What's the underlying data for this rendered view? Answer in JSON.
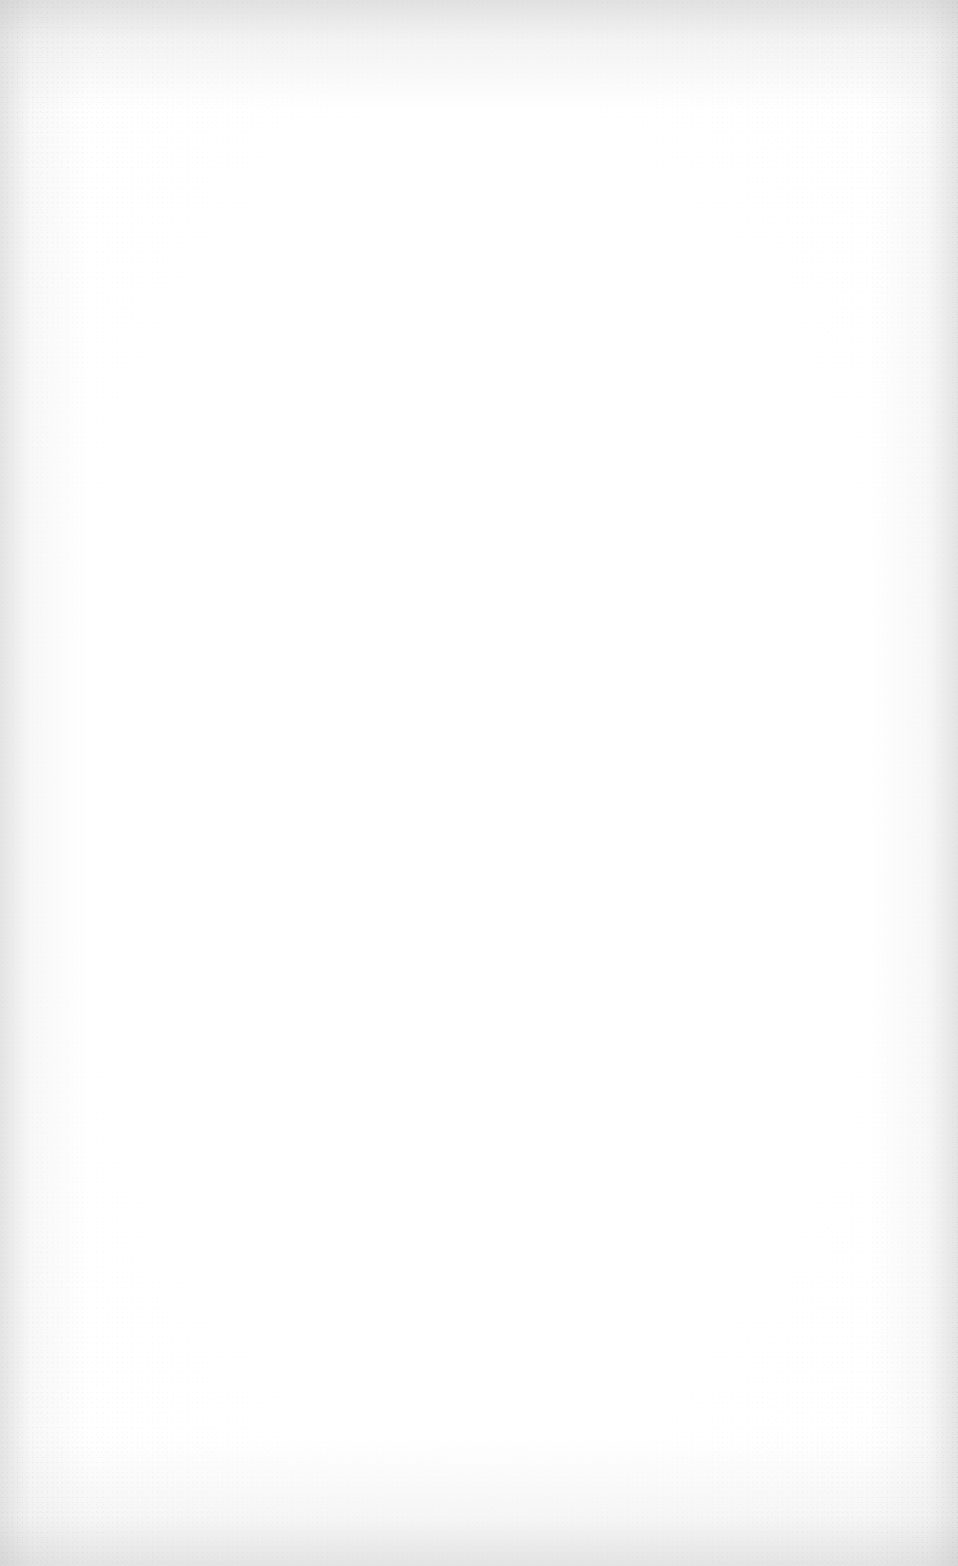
{
  "page": {
    "type": "blank-scanned-page",
    "text": "",
    "background_color": "#ffffff",
    "edge_color": "#d0d0d0"
  }
}
